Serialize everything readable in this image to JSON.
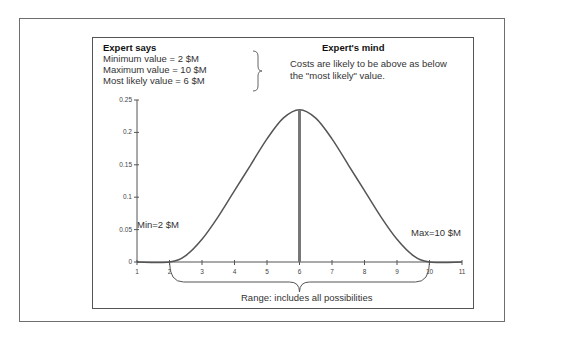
{
  "expert_says": {
    "title": "Expert says",
    "lines": [
      "Minimum value = 2 $M",
      "Maximum value = 10 $M",
      "Most likely value = 6 $M"
    ]
  },
  "expert_mind": {
    "title": "Expert's mind",
    "lines": [
      "Costs are likely to be above as below",
      "the \"most likely\" value."
    ]
  },
  "chart_data": {
    "type": "line",
    "title": "",
    "xlabel": "",
    "ylabel": "",
    "xlim": [
      1,
      11
    ],
    "ylim": [
      0,
      0.25
    ],
    "xticks": [
      1,
      2,
      3,
      4,
      5,
      6,
      7,
      8,
      9,
      10,
      11
    ],
    "yticks": [
      0,
      0.05,
      0.1,
      0.15,
      0.2,
      0.25
    ],
    "ytick_labels": [
      "0",
      "0.05",
      "0.1",
      "0.15",
      "0.2",
      "0.25"
    ],
    "grid": false,
    "series": [
      {
        "name": "probability density",
        "x": [
          1,
          2,
          2.5,
          3,
          3.5,
          4,
          4.5,
          5,
          5.5,
          6,
          6.5,
          7,
          7.5,
          8,
          8.5,
          9,
          9.5,
          10,
          11
        ],
        "y": [
          0,
          0,
          0.01,
          0.035,
          0.07,
          0.11,
          0.15,
          0.19,
          0.222,
          0.235,
          0.222,
          0.19,
          0.15,
          0.11,
          0.07,
          0.035,
          0.01,
          0,
          0
        ]
      }
    ],
    "mode_line": {
      "x": 6,
      "y": 0.235
    },
    "annotations": {
      "min": "Min=2 $M",
      "max": "Max=10 $M",
      "range": "Range: includes all possibilities"
    }
  }
}
